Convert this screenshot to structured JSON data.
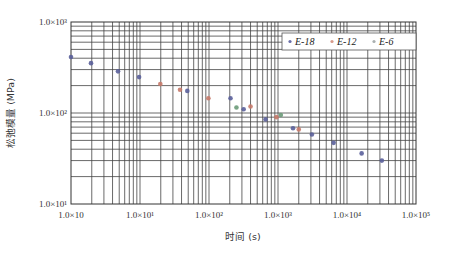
{
  "chart_data": {
    "type": "scatter",
    "title": "",
    "xlabel": "时间 (s)",
    "ylabel": "松弛模量 (MPa)",
    "xscale": "log",
    "yscale": "log",
    "xlim": [
      1,
      100000
    ],
    "ylim": [
      10,
      1000
    ],
    "x_tick_labels": [
      "1.0×10",
      "1.0×10¹",
      "1.0×10²",
      "1.0×10³",
      "1.0×10⁴",
      "1.0×10⁵"
    ],
    "x_ticks": [
      1,
      10,
      100,
      1000,
      10000,
      100000
    ],
    "y_tick_labels": [
      "1.0×10¹",
      "1.0×10²",
      "1.0×10³"
    ],
    "y_ticks": [
      10,
      100,
      1000
    ],
    "grid": true,
    "legend_position": "upper right",
    "series": [
      {
        "name": "E-18",
        "color": "#5a5f9a",
        "points": [
          [
            1,
            412
          ],
          [
            1.95,
            353
          ],
          [
            4.8,
            287
          ],
          [
            9.7,
            248
          ],
          [
            48.5,
            175
          ],
          [
            205,
            145
          ],
          [
            318,
            110
          ],
          [
            660,
            85
          ],
          [
            1650,
            68
          ],
          [
            3100,
            58
          ],
          [
            6400,
            47
          ],
          [
            16300,
            36
          ],
          [
            32000,
            30
          ]
        ]
      },
      {
        "name": "E-12",
        "color": "#c77a6a",
        "points": [
          [
            19.7,
            208
          ],
          [
            38,
            180
          ],
          [
            98,
            145
          ],
          [
            400,
            118
          ],
          [
            950,
            90
          ],
          [
            2000,
            66
          ]
        ]
      },
      {
        "name": "E-6",
        "color": "#6a9a78",
        "points": [
          [
            250,
            115
          ],
          [
            1100,
            95
          ]
        ]
      }
    ]
  },
  "legend": {
    "items": [
      {
        "label": "E-18",
        "color": "#6a6fa8"
      },
      {
        "label": "E-12",
        "color": "#d79a8a"
      },
      {
        "label": "E-6",
        "color": "#aab0b0"
      }
    ]
  }
}
